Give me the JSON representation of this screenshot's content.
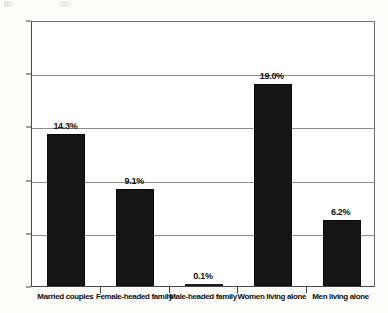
{
  "chart_data": {
    "type": "bar",
    "title": "",
    "subtitle": "",
    "xlabel": "",
    "ylabel": "",
    "categories": [
      "Married couples",
      "Female-headed family",
      "Male-headed family",
      "Women living alone",
      "Men living alone"
    ],
    "values": [
      14.3,
      9.1,
      0.1,
      19.0,
      6.2
    ],
    "data_labels": [
      "14.3%",
      "9.1%",
      "0.1%",
      "19.0%",
      "6.2%"
    ],
    "ylim": [
      0,
      25
    ],
    "ytick_values": [
      0,
      5,
      10,
      15,
      20,
      25
    ],
    "ytick_labels": [
      "0%",
      "5%",
      "10%",
      "15%",
      "20%",
      "25%"
    ],
    "grid": true,
    "grid_axis": "y",
    "legend": false,
    "legend_position": "none",
    "bar_color": "#161616",
    "gridline_color": "#8d8d8d",
    "axis_color": "#4a4a4a",
    "background_color": "#ffffff"
  }
}
